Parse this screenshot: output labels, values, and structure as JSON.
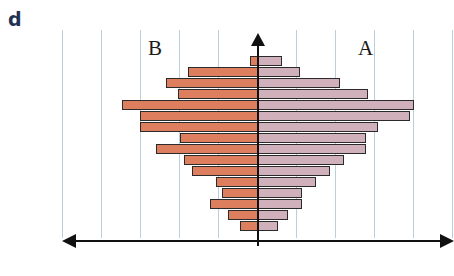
{
  "panel": {
    "letter": "d"
  },
  "labels": {
    "left_group": "B",
    "right_group": "A"
  },
  "colors": {
    "left_bar_fill": "#dd7f5f",
    "right_bar_fill": "#cfb0bb",
    "bar_outline": "#2b2b2b",
    "gridline": "#b9cfdd",
    "axis": "#111111",
    "panel_letter": "#1f3253"
  },
  "chart_data": {
    "type": "bar",
    "subtype": "population-pyramid",
    "title": "",
    "subtitle": "",
    "xlabel": "",
    "ylabel": "",
    "grid": true,
    "gridline_count": 10,
    "legend_position": "in-plot-top",
    "orientation": "horizontal-back-to-back",
    "axis_center_label": "0",
    "series": [
      {
        "name": "B",
        "side": "left",
        "color": "#dd7f5f",
        "values": [
          8,
          70,
          92,
          80,
          136,
          118,
          118,
          78,
          102,
          74,
          66,
          42,
          36,
          48,
          30,
          18,
          0,
          0
        ]
      },
      {
        "name": "A",
        "side": "right",
        "color": "#cfb0bb",
        "values": [
          24,
          42,
          82,
          110,
          156,
          152,
          120,
          108,
          108,
          86,
          72,
          58,
          44,
          44,
          30,
          20,
          0,
          0
        ]
      }
    ],
    "categories": [
      "row-1",
      "row-2",
      "row-3",
      "row-4",
      "row-5",
      "row-6",
      "row-7",
      "row-8",
      "row-9",
      "row-10",
      "row-11",
      "row-12",
      "row-13",
      "row-14",
      "row-15",
      "row-16",
      "row-17",
      "row-18"
    ],
    "annotations": [
      {
        "text": "B",
        "position": "upper-left"
      },
      {
        "text": "A",
        "position": "upper-right"
      }
    ]
  },
  "geometry": {
    "gridline_x": [
      22,
      61,
      100,
      139,
      178,
      256,
      295,
      334,
      373,
      412
    ],
    "center_x": 218,
    "row_height": 11,
    "row_gap": 0,
    "first_row_top": 26,
    "bar_height": 10
  }
}
